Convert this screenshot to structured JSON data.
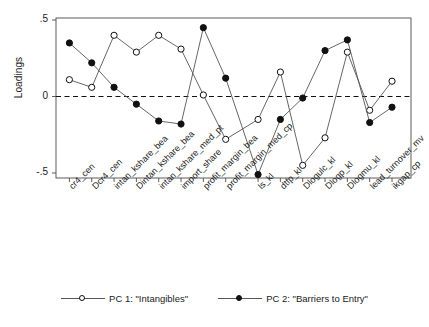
{
  "chart_data": {
    "type": "line",
    "title": "",
    "xlabel": "",
    "ylabel": "Loadings",
    "ylim": [
      -0.6,
      0.55
    ],
    "yticks": [
      0.5,
      0,
      -0.5
    ],
    "ytick_labels": [
      ".5",
      "0",
      "-.5"
    ],
    "grid": false,
    "zero_line": true,
    "legend_position": "bottom",
    "categories": [
      "cr4_cen",
      "Dcr4_cen",
      "intan_kshare_bea",
      "Dintan_kshare_bea",
      "intan_kshare_med_pt",
      "import_share",
      "profit_margin_bea",
      "profit_margin_med_cp",
      "ls_kl",
      "dtfp_kl",
      "Dlogulc_kl",
      "Dlogp_kl",
      "Dlogmu_kl",
      "lead_turnover_mv",
      "ikgap_cp"
    ],
    "group_break_after_index": 7,
    "series": [
      {
        "name": "PC 1: \"Intangibles\"",
        "marker": "open-circle",
        "values": [
          0.11,
          0.06,
          0.4,
          0.29,
          0.4,
          0.31,
          0.01,
          -0.28,
          -0.15,
          0.16,
          -0.45,
          -0.27,
          0.29,
          -0.09,
          0.1
        ]
      },
      {
        "name": "PC 2: \"Barriers to Entry\"",
        "marker": "filled-circle",
        "values": [
          0.35,
          0.22,
          0.06,
          -0.05,
          -0.16,
          -0.18,
          0.45,
          0.12,
          -0.51,
          -0.15,
          -0.01,
          0.3,
          0.37,
          -0.17,
          -0.07
        ]
      }
    ]
  },
  "axis": {
    "ylabel": "Loadings",
    "ytick_labels": [
      ".5",
      "0",
      "-.5"
    ]
  },
  "legend": {
    "entries": [
      {
        "label": "PC 1: \"Intangibles\"",
        "marker": "open-circle"
      },
      {
        "label": "PC 2: \"Barriers to Entry\"",
        "marker": "filled-circle"
      }
    ]
  },
  "colors": {
    "series_line": "#555555",
    "marker_edge": "#111111",
    "marker_fill_open": "#ffffff",
    "marker_fill_closed": "#111111",
    "frame": "#4a4a4a",
    "zero_line": "#111111",
    "text": "#1b1b1b"
  }
}
